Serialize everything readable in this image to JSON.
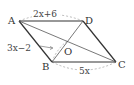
{
  "figure": {
    "type": "parallelogram",
    "vertices": {
      "A": {
        "label": "A",
        "x": 19,
        "y": 21
      },
      "D": {
        "label": "D",
        "x": 83,
        "y": 21
      },
      "B": {
        "label": "B",
        "x": 52,
        "y": 62
      },
      "C": {
        "label": "C",
        "x": 116,
        "y": 62
      },
      "O": {
        "label": "O",
        "x": 67,
        "y": 41
      }
    },
    "measurements": {
      "AD": "2x+6",
      "BO": "3x−2",
      "BC": "5x"
    },
    "colors": {
      "edge": "#333333",
      "dash": "#aaaaaa",
      "background": "#ffffff"
    }
  }
}
